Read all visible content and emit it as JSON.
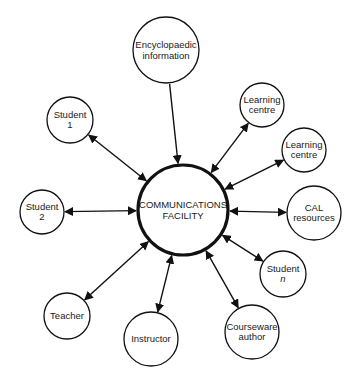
{
  "diagram": {
    "type": "hub-and-spoke",
    "hub": {
      "id": "hub",
      "lines": [
        "COMMUNICATIONS",
        "FACILITY"
      ],
      "cx": 183,
      "cy": 210,
      "r": 45
    },
    "nodes": [
      {
        "id": "encyclopaedic",
        "lines": [
          "Encyclopaedic",
          "information"
        ],
        "cx": 166,
        "cy": 50,
        "r": 33,
        "direction": "to-hub"
      },
      {
        "id": "learning-centre-1",
        "lines": [
          "Learning",
          "centre"
        ],
        "cx": 262,
        "cy": 105,
        "r": 22,
        "direction": "both"
      },
      {
        "id": "learning-centre-2",
        "lines": [
          "Learning",
          "centre"
        ],
        "cx": 304,
        "cy": 150,
        "r": 22,
        "direction": "both"
      },
      {
        "id": "cal-resources",
        "lines": [
          "CAL",
          "resources"
        ],
        "cx": 314,
        "cy": 213,
        "r": 27,
        "direction": "both"
      },
      {
        "id": "student-n",
        "lines": [
          "Student",
          "n"
        ],
        "cx": 283,
        "cy": 274,
        "r": 23,
        "direction": "both",
        "italic_second_line": true
      },
      {
        "id": "courseware-author",
        "lines": [
          "Courseware",
          "author"
        ],
        "cx": 252,
        "cy": 332,
        "r": 27,
        "direction": "both"
      },
      {
        "id": "instructor",
        "lines": [
          "Instructor"
        ],
        "cx": 151,
        "cy": 339,
        "r": 27,
        "direction": "both"
      },
      {
        "id": "teacher",
        "lines": [
          "Teacher"
        ],
        "cx": 67,
        "cy": 316,
        "r": 23,
        "direction": "both"
      },
      {
        "id": "student-2",
        "lines": [
          "Student",
          "2"
        ],
        "cx": 42,
        "cy": 212,
        "r": 22,
        "direction": "both"
      },
      {
        "id": "student-1",
        "lines": [
          "Student",
          "1"
        ],
        "cx": 70,
        "cy": 120,
        "r": 23,
        "direction": "both"
      }
    ],
    "colors": {
      "stroke": "#111111",
      "background": "#ffffff",
      "text": "#1a1a1a"
    }
  }
}
